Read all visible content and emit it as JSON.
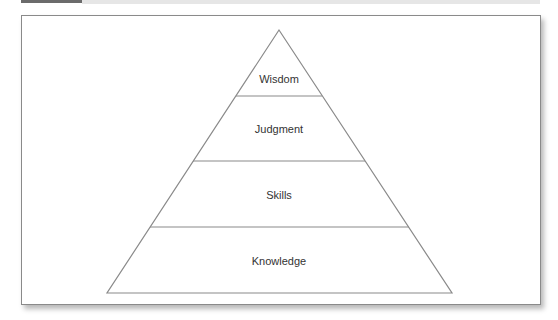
{
  "figure": {
    "type": "pyramid",
    "levels_top_to_bottom": [
      {
        "label": "Wisdom"
      },
      {
        "label": "Judgment"
      },
      {
        "label": "Skills"
      },
      {
        "label": "Knowledge"
      }
    ]
  },
  "colors": {
    "line": "#8a8a8a",
    "text": "#333333",
    "background": "#ffffff",
    "header_dark": "#6b6b6b",
    "header_light": "#e6e6e6"
  }
}
